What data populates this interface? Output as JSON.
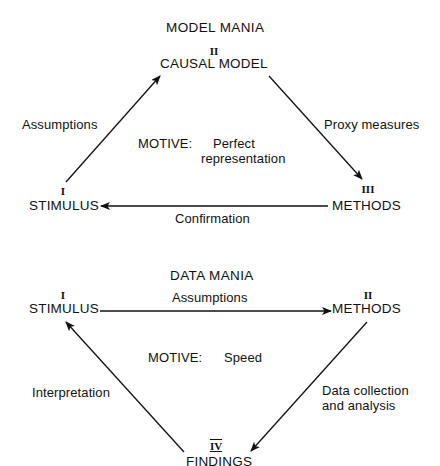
{
  "model_mania": {
    "title": "MODEL MANIA",
    "nodes": {
      "causal_model": {
        "numeral": "II",
        "label": "CAUSAL MODEL"
      },
      "stimulus": {
        "numeral": "I",
        "label": "STIMULUS"
      },
      "methods": {
        "numeral": "III",
        "label": "METHODS"
      }
    },
    "edges": {
      "stimulus_to_causal_model": "Assumptions",
      "causal_model_to_methods": "Proxy measures",
      "methods_to_stimulus": "Confirmation"
    },
    "motive": {
      "label": "MOTIVE:",
      "value_line1": "Perfect",
      "value_line2": "representation"
    }
  },
  "data_mania": {
    "title": "DATA MANIA",
    "nodes": {
      "stimulus": {
        "numeral": "I",
        "label": "STIMULUS"
      },
      "methods": {
        "numeral": "II",
        "label": "METHODS"
      },
      "findings": {
        "numeral": "IV",
        "label": "FINDINGS"
      }
    },
    "edges": {
      "stimulus_to_methods": "Assumptions",
      "methods_to_findings_line1": "Data collection",
      "methods_to_findings_line2": "and analysis",
      "findings_to_stimulus": "Interpretation"
    },
    "motive": {
      "label": "MOTIVE:",
      "value": "Speed"
    }
  },
  "colors": {
    "ink": "#111111",
    "background": "#ffffff"
  }
}
